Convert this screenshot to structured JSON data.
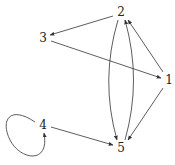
{
  "graph": {
    "type": "directed",
    "nodes": [
      {
        "id": "1",
        "label": "1"
      },
      {
        "id": "2",
        "label": "2"
      },
      {
        "id": "3",
        "label": "3"
      },
      {
        "id": "4",
        "label": "4"
      },
      {
        "id": "5",
        "label": "5"
      }
    ],
    "edges": [
      {
        "from": "2",
        "to": "3"
      },
      {
        "from": "3",
        "to": "1"
      },
      {
        "from": "1",
        "to": "2"
      },
      {
        "from": "1",
        "to": "5"
      },
      {
        "from": "2",
        "to": "5"
      },
      {
        "from": "5",
        "to": "2"
      },
      {
        "from": "4",
        "to": "5"
      },
      {
        "from": "4",
        "to": "4"
      }
    ],
    "edge_color": "#333333",
    "label_color": "#222222"
  }
}
